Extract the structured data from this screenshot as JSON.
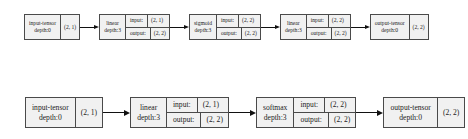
{
  "theme": {
    "background": "#ffffff",
    "node_fill": "#f1f1f1",
    "node_border": "#4a4a4a",
    "text_color": "#1c1c1c",
    "arrow_color": "#111111"
  },
  "graph": {
    "rows": [
      {
        "name": "top-graph",
        "nodes": [
          {
            "type": "tensor",
            "title": "input-tensor",
            "subtitle": "depth:0",
            "shape": "(2, 1)"
          },
          {
            "type": "op",
            "title": "linear",
            "subtitle": "depth:3",
            "input_label": "input:",
            "input_shape": "(2, 1)",
            "output_label": "output:",
            "output_shape": "(2, 2)"
          },
          {
            "type": "op",
            "title": "sigmoid",
            "subtitle": "depth:3",
            "input_label": "input:",
            "input_shape": "(2, 2)",
            "output_label": "output:",
            "output_shape": "(2, 2)"
          },
          {
            "type": "op",
            "title": "linear",
            "subtitle": "depth:3",
            "input_label": "input:",
            "input_shape": "(2, 2)",
            "output_label": "output:",
            "output_shape": "(2, 2)"
          },
          {
            "type": "tensor",
            "title": "output-tensor",
            "subtitle": "depth:0",
            "shape": "(2, 2)"
          }
        ]
      },
      {
        "name": "bottom-graph",
        "nodes": [
          {
            "type": "tensor",
            "title": "input-tensor",
            "subtitle": "depth:0",
            "shape": "(2, 1)"
          },
          {
            "type": "op",
            "title": "linear",
            "subtitle": "depth:3",
            "input_label": "input:",
            "input_shape": "(2, 1)",
            "output_label": "output:",
            "output_shape": "(2, 2)"
          },
          {
            "type": "op",
            "title": "softmax",
            "subtitle": "depth:3",
            "input_label": "input:",
            "input_shape": "(2, 2)",
            "output_label": "output:",
            "output_shape": "(2, 2)"
          },
          {
            "type": "tensor",
            "title": "output-tensor",
            "subtitle": "depth:0",
            "shape": "(2, 2)"
          }
        ]
      }
    ]
  }
}
